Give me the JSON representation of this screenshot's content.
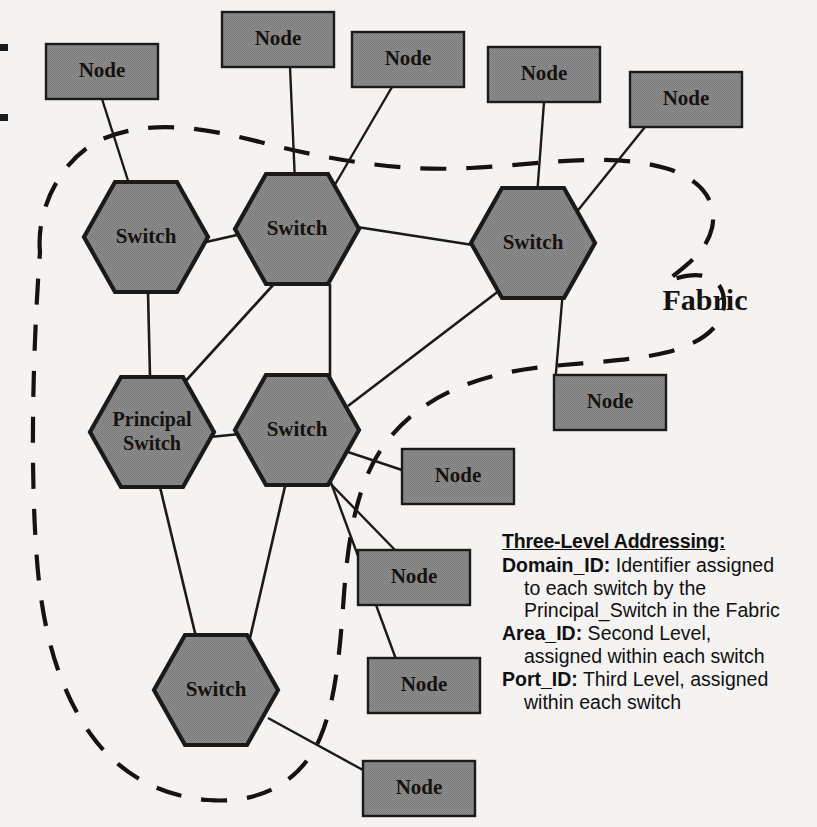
{
  "diagram": {
    "title_label": "Fabric",
    "boundary_name": "fabric-boundary",
    "switches": [
      {
        "id": "sw-upper-left",
        "label": "Switch",
        "cx": 146,
        "cy": 237
      },
      {
        "id": "sw-upper-mid",
        "label": "Switch",
        "cx": 297,
        "cy": 229
      },
      {
        "id": "sw-upper-right",
        "label": "Switch",
        "cx": 533,
        "cy": 243
      },
      {
        "id": "sw-principal",
        "label": "Principal Switch",
        "line1": "Principal",
        "line2": "Switch",
        "cx": 152,
        "cy": 432
      },
      {
        "id": "sw-mid",
        "label": "Switch",
        "cx": 297,
        "cy": 430
      },
      {
        "id": "sw-bottom",
        "label": "Switch",
        "cx": 216,
        "cy": 690
      }
    ],
    "nodes": [
      {
        "id": "node-1",
        "label": "Node",
        "x": 46,
        "y": 44,
        "w": 112,
        "h": 55
      },
      {
        "id": "node-2",
        "label": "Node",
        "x": 222,
        "y": 12,
        "w": 112,
        "h": 55
      },
      {
        "id": "node-3",
        "label": "Node",
        "x": 352,
        "y": 32,
        "w": 112,
        "h": 55
      },
      {
        "id": "node-4",
        "label": "Node",
        "x": 488,
        "y": 47,
        "w": 112,
        "h": 55
      },
      {
        "id": "node-5",
        "label": "Node",
        "x": 630,
        "y": 72,
        "w": 112,
        "h": 55
      },
      {
        "id": "node-6",
        "label": "Node",
        "x": 554,
        "y": 375,
        "w": 112,
        "h": 55
      },
      {
        "id": "node-7",
        "label": "Node",
        "x": 402,
        "y": 449,
        "w": 112,
        "h": 55
      },
      {
        "id": "node-8",
        "label": "Node",
        "x": 358,
        "y": 550,
        "w": 112,
        "h": 55
      },
      {
        "id": "node-9",
        "label": "Node",
        "x": 368,
        "y": 658,
        "w": 112,
        "h": 55
      },
      {
        "id": "node-10",
        "label": "Node",
        "x": 363,
        "y": 761,
        "w": 112,
        "h": 55
      }
    ],
    "colors": {
      "shape_fill": "#8a8a8a",
      "shape_stroke": "#1c1a18",
      "link_stroke": "#1c1a18",
      "boundary_stroke": "#15120f",
      "background": "#f4f3f1",
      "text": "#15120f"
    }
  },
  "legend": {
    "heading": "Three-Level Addressing:",
    "entries": [
      {
        "term": "Domain_ID:",
        "first_line": " Identifier assigned",
        "continuations": [
          "to each switch by the",
          "Principal_Switch in the Fabric"
        ]
      },
      {
        "term": "Area_ID:",
        "first_line": " Second Level,",
        "continuations": [
          "assigned within each switch"
        ]
      },
      {
        "term": "Port_ID:",
        "first_line": " Third Level, assigned",
        "continuations": [
          "within each switch"
        ]
      }
    ]
  }
}
